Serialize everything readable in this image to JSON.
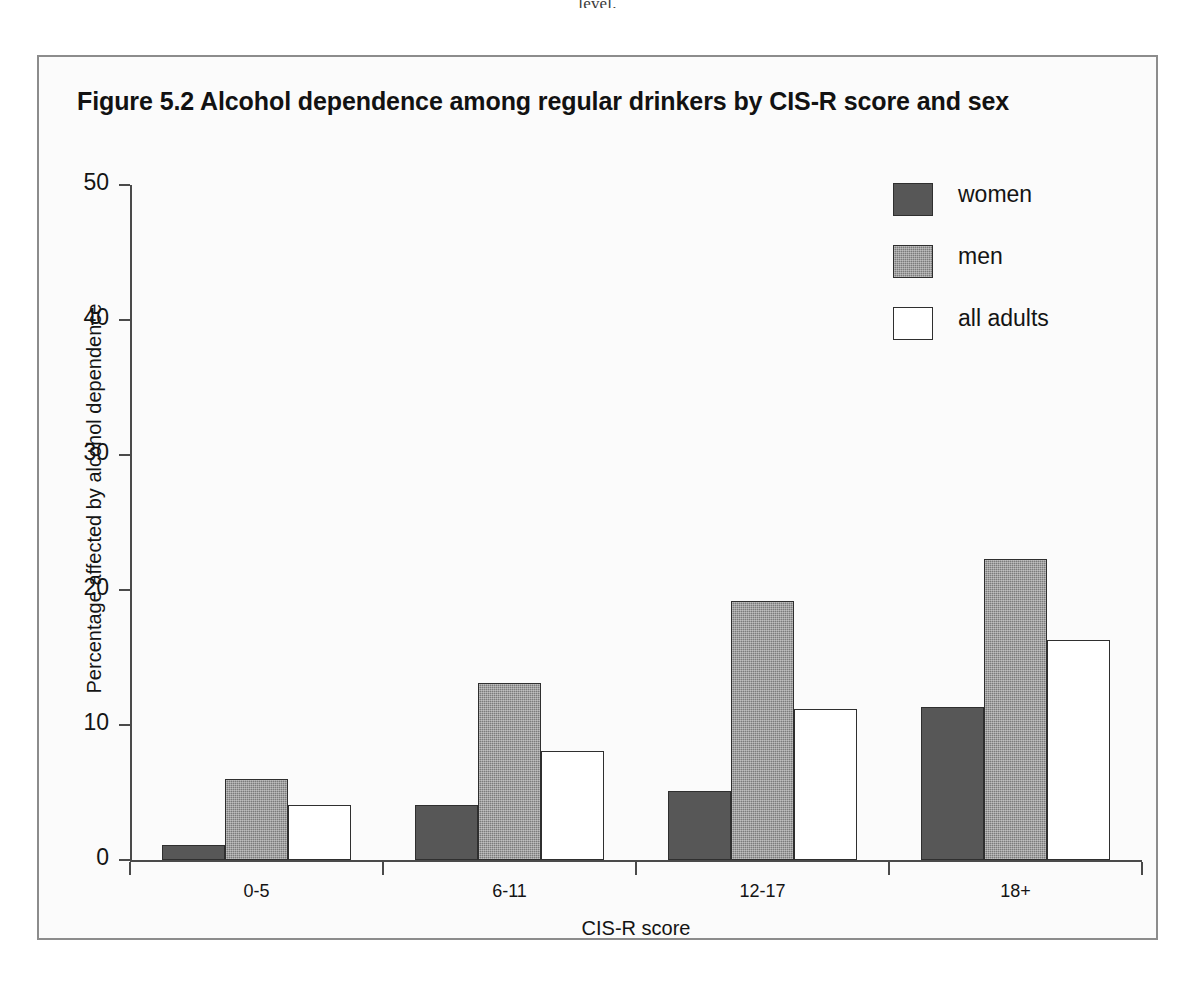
{
  "page_fragment": "level.",
  "figure": {
    "title": "Figure 5.2   Alcohol dependence among regular drinkers by CIS-R score and sex"
  },
  "legend": {
    "position": "top-right",
    "entries": [
      {
        "label": "women",
        "swatch": "dark-gray-solid",
        "color": "#575757"
      },
      {
        "label": "men",
        "swatch": "medium-gray-dither",
        "color": "#7b7b7b"
      },
      {
        "label": "all adults",
        "swatch": "white-outline",
        "color": "#ffffff"
      }
    ]
  },
  "chart_data": {
    "type": "bar",
    "title": "Figure 5.2   Alcohol dependence among regular drinkers by CIS-R score and sex",
    "xlabel": "CIS-R score",
    "ylabel": "Percentage affected by alcohol dependence",
    "categories": [
      "0-5",
      "6-11",
      "12-17",
      "18+"
    ],
    "series": [
      {
        "name": "women",
        "color": "#575757",
        "values": [
          1.1,
          4.1,
          5.1,
          11.3
        ]
      },
      {
        "name": "men",
        "color": "#7b7b7b",
        "values": [
          6.0,
          13.1,
          19.2,
          22.3
        ]
      },
      {
        "name": "all adults",
        "color": "#ffffff",
        "values": [
          4.1,
          8.1,
          11.2,
          16.3
        ]
      }
    ],
    "ylim": [
      0,
      50
    ],
    "yticks": [
      0,
      10,
      20,
      30,
      40,
      50
    ],
    "ytick_labels": [
      "0",
      "10",
      "20",
      "30",
      "40",
      "50"
    ],
    "grid": false,
    "legend_position": "top-right"
  }
}
